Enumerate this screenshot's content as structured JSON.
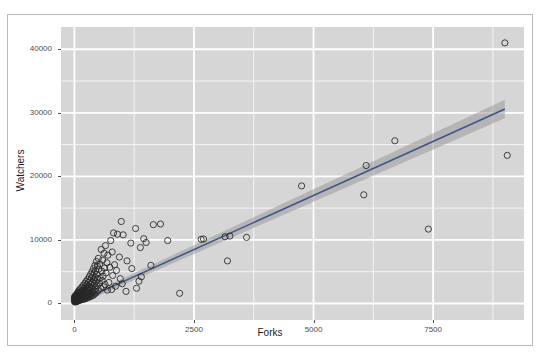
{
  "top_partial_text": "·   ·    ·",
  "figure": {
    "title": "",
    "panel_bg_color": "#d6d6d6",
    "gridline_color": "#ffffff",
    "point_color": "#262626",
    "line_color": "#3c5488",
    "ribbon_color": "#9a9a9a",
    "border_color": "#b9b9bd"
  },
  "chart_data": {
    "type": "scatter",
    "title": "",
    "subtitle": "",
    "xlabel": "Forks",
    "ylabel": "Watchers",
    "xlim": [
      -280,
      9400
    ],
    "ylim": [
      -2600,
      43500
    ],
    "xticks": [
      0,
      2500,
      5000,
      7500
    ],
    "xticklabels": [
      "0",
      "2500",
      "5000",
      "7500"
    ],
    "yticks": [
      0,
      10000,
      20000,
      30000,
      40000
    ],
    "yticklabels": [
      "0",
      "10000",
      "20000",
      "30000",
      "40000"
    ],
    "grid": true,
    "minor_grid": true,
    "legend": "none",
    "marker": "open-circle",
    "marker_size": 3.1,
    "regression": {
      "type": "linear-fit-with-confidence-ribbon",
      "x_start": 60,
      "x_end": 9000,
      "y_start": 180,
      "y_end": 30600,
      "ribbon_half_width_start": 420,
      "ribbon_half_width_end": 1450,
      "method": "lm"
    },
    "series": [
      {
        "name": "repositories",
        "points": [
          [
            9000,
            41000
          ],
          [
            9050,
            23300
          ],
          [
            7400,
            11700
          ],
          [
            6700,
            25600
          ],
          [
            6050,
            17100
          ],
          [
            6100,
            21700
          ],
          [
            4750,
            18500
          ],
          [
            3600,
            10400
          ],
          [
            3200,
            6700
          ],
          [
            3250,
            10600
          ],
          [
            3150,
            10500
          ],
          [
            2650,
            10100
          ],
          [
            2700,
            10150
          ],
          [
            2200,
            1600
          ],
          [
            1950,
            9900
          ],
          [
            1800,
            12500
          ],
          [
            1650,
            12400
          ],
          [
            1600,
            6000
          ],
          [
            1500,
            9600
          ],
          [
            1450,
            10200
          ],
          [
            1400,
            4200
          ],
          [
            1380,
            8800
          ],
          [
            1350,
            3500
          ],
          [
            1300,
            2400
          ],
          [
            1280,
            11800
          ],
          [
            1200,
            5500
          ],
          [
            1180,
            9500
          ],
          [
            1100,
            6700
          ],
          [
            1080,
            1900
          ],
          [
            1020,
            10800
          ],
          [
            1000,
            3100
          ],
          [
            980,
            12900
          ],
          [
            960,
            3900
          ],
          [
            940,
            7300
          ],
          [
            900,
            10900
          ],
          [
            880,
            5200
          ],
          [
            860,
            2700
          ],
          [
            840,
            6100
          ],
          [
            820,
            11100
          ],
          [
            800,
            4400
          ],
          [
            790,
            8100
          ],
          [
            780,
            2200
          ],
          [
            760,
            9900
          ],
          [
            740,
            5700
          ],
          [
            720,
            3300
          ],
          [
            700,
            7600
          ],
          [
            690,
            2100
          ],
          [
            680,
            6400
          ],
          [
            660,
            4800
          ],
          [
            650,
            9100
          ],
          [
            640,
            3000
          ],
          [
            630,
            5600
          ],
          [
            620,
            7900
          ],
          [
            610,
            2600
          ],
          [
            600,
            4300
          ],
          [
            590,
            6800
          ],
          [
            580,
            3600
          ],
          [
            570,
            5100
          ],
          [
            560,
            8500
          ],
          [
            550,
            2400
          ],
          [
            540,
            4000
          ],
          [
            530,
            6200
          ],
          [
            520,
            3200
          ],
          [
            510,
            5400
          ],
          [
            500,
            7100
          ],
          [
            495,
            2000
          ],
          [
            490,
            3800
          ],
          [
            480,
            5900
          ],
          [
            470,
            2800
          ],
          [
            465,
            4600
          ],
          [
            460,
            6600
          ],
          [
            455,
            1700
          ],
          [
            450,
            3400
          ],
          [
            445,
            5200
          ],
          [
            440,
            2300
          ],
          [
            435,
            4100
          ],
          [
            430,
            6000
          ],
          [
            425,
            1500
          ],
          [
            420,
            3100
          ],
          [
            415,
            4800
          ],
          [
            410,
            2000
          ],
          [
            405,
            3700
          ],
          [
            400,
            5500
          ],
          [
            395,
            1300
          ],
          [
            390,
            2800
          ],
          [
            385,
            4400
          ],
          [
            380,
            1800
          ],
          [
            375,
            3300
          ],
          [
            370,
            5000
          ],
          [
            365,
            1200
          ],
          [
            360,
            2500
          ],
          [
            355,
            4000
          ],
          [
            350,
            1600
          ],
          [
            345,
            3000
          ],
          [
            340,
            4600
          ],
          [
            335,
            1100
          ],
          [
            330,
            2300
          ],
          [
            325,
            3600
          ],
          [
            320,
            1400
          ],
          [
            315,
            2700
          ],
          [
            310,
            4200
          ],
          [
            305,
            1000
          ],
          [
            300,
            2100
          ],
          [
            295,
            3300
          ],
          [
            290,
            1300
          ],
          [
            285,
            2500
          ],
          [
            280,
            3800
          ],
          [
            275,
            900
          ],
          [
            270,
            1900
          ],
          [
            265,
            3000
          ],
          [
            260,
            1200
          ],
          [
            255,
            2300
          ],
          [
            250,
            3500
          ],
          [
            245,
            800
          ],
          [
            240,
            1700
          ],
          [
            235,
            2700
          ],
          [
            230,
            1100
          ],
          [
            225,
            2100
          ],
          [
            220,
            3200
          ],
          [
            215,
            700
          ],
          [
            210,
            1500
          ],
          [
            205,
            2400
          ],
          [
            200,
            1000
          ],
          [
            195,
            1900
          ],
          [
            190,
            2900
          ],
          [
            185,
            650
          ],
          [
            180,
            1350
          ],
          [
            175,
            2150
          ],
          [
            170,
            900
          ],
          [
            165,
            1700
          ],
          [
            160,
            2600
          ],
          [
            155,
            600
          ],
          [
            150,
            1200
          ],
          [
            145,
            1950
          ],
          [
            140,
            820
          ],
          [
            135,
            1550
          ],
          [
            130,
            2350
          ],
          [
            125,
            540
          ],
          [
            120,
            1100
          ],
          [
            115,
            1750
          ],
          [
            110,
            740
          ],
          [
            105,
            1400
          ],
          [
            100,
            2100
          ],
          [
            98,
            480
          ],
          [
            95,
            980
          ],
          [
            92,
            1580
          ],
          [
            90,
            660
          ],
          [
            88,
            1250
          ],
          [
            85,
            1900
          ],
          [
            82,
            430
          ],
          [
            80,
            880
          ],
          [
            78,
            1420
          ],
          [
            75,
            590
          ],
          [
            72,
            1120
          ],
          [
            70,
            1700
          ],
          [
            68,
            380
          ],
          [
            65,
            790
          ],
          [
            62,
            1280
          ],
          [
            60,
            530
          ],
          [
            58,
            1010
          ],
          [
            55,
            1530
          ],
          [
            52,
            340
          ],
          [
            50,
            710
          ],
          [
            48,
            1150
          ],
          [
            45,
            470
          ],
          [
            42,
            910
          ],
          [
            40,
            1380
          ],
          [
            38,
            300
          ],
          [
            35,
            640
          ],
          [
            32,
            1030
          ],
          [
            30,
            420
          ],
          [
            28,
            820
          ],
          [
            25,
            1240
          ],
          [
            22,
            265
          ],
          [
            20,
            570
          ],
          [
            18,
            920
          ],
          [
            15,
            375
          ],
          [
            12,
            730
          ],
          [
            10,
            1110
          ],
          [
            8,
            230
          ],
          [
            6,
            510
          ],
          [
            5,
            820
          ],
          [
            4,
            335
          ],
          [
            3,
            650
          ],
          [
            2,
            990
          ]
        ]
      }
    ]
  }
}
